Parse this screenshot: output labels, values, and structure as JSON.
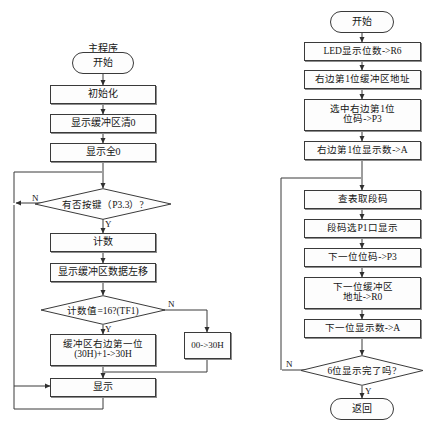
{
  "page": {
    "background": "#ffffff",
    "line_color": "#3a3a3a",
    "text_color": "#151515"
  },
  "left_chart": {
    "title": "主程序",
    "nodes": {
      "start": "开始",
      "init": "初始化",
      "clear_buffer": "显示缓冲区清0",
      "show_all_zero": "显示全0",
      "key_decision": "有否按键（P3.3）?",
      "count": "计数",
      "shift_left": "显示缓冲区数据左移",
      "count_decision": "计数值=16?(TF1)",
      "inc_buffer_line1": "缓冲区右边第一位",
      "inc_buffer_line2": "(30H)+1->30H",
      "reset_box": "00->30H",
      "display": "显示"
    },
    "branch_labels": {
      "key_no": "N",
      "key_yes": "Y",
      "count_no": "N",
      "count_yes": "Y"
    }
  },
  "right_chart": {
    "nodes": {
      "start": "开始",
      "led_digits": "LED显示位数->R6",
      "first_buffer_addr": "右边第1位缓冲区地址",
      "select_first_line1": "选中右边第1位",
      "select_first_line2": "位码->P3",
      "first_digit_to_a": "右边第1位显示数->A",
      "lookup_segment": "查表取段码",
      "segment_to_p1": "段码选P1口显示",
      "next_bitcode": "下一位位码->P3",
      "next_buffer_line1": "下一位缓冲区",
      "next_buffer_line2": "地址->R0",
      "next_digit_to_a": "下一位显示数->A",
      "done_decision": "6位显示完了吗?",
      "return": "返回"
    },
    "branch_labels": {
      "done_no": "N",
      "done_yes": "Y"
    }
  }
}
